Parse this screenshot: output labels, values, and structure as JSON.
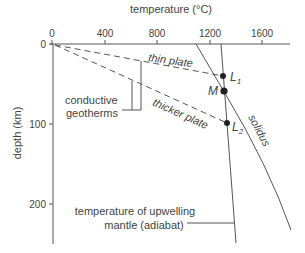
{
  "diagram": {
    "x_axis": {
      "title": "temperature (°C)",
      "ticks": [
        "0",
        "400",
        "800",
        "1200",
        "1600"
      ]
    },
    "y_axis": {
      "title": "depth (km)",
      "ticks": [
        "0",
        "100",
        "200"
      ]
    },
    "curves": {
      "thin_plate": "thin plate",
      "thicker_plate": "thicker plate",
      "solidus": "solidus"
    },
    "points": {
      "L1": "L",
      "L1_sub": "1",
      "M": "M",
      "L2": "L",
      "L2_sub": "2"
    },
    "annotations": {
      "conductive_line1": "conductive",
      "conductive_line2": "geotherms",
      "adiabat_line1": "temperature of upwelling",
      "adiabat_line2": "mantle (adiabat)"
    },
    "colors": {
      "line": "#555555",
      "text": "#444444"
    }
  }
}
